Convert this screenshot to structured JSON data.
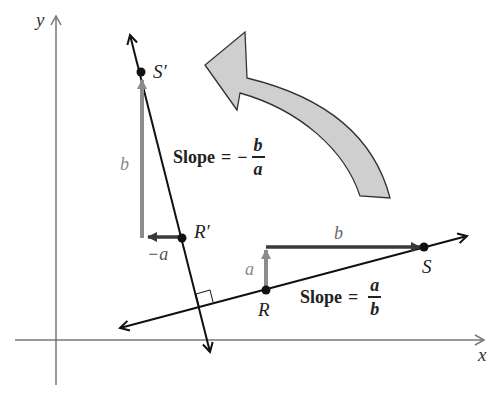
{
  "figure": {
    "axes": {
      "x_label": "x",
      "y_label": "y"
    },
    "points": {
      "S_prime": "S′",
      "R_prime": "R′",
      "R": "R",
      "S": "S"
    },
    "vectors": {
      "rise_original": "a",
      "run_original": "b",
      "rise_rotated": "b",
      "run_rotated": "−a"
    },
    "slope_rotated": {
      "prefix": "Slope",
      "equals": "=",
      "sign": "−",
      "numerator": "b",
      "denominator": "a"
    },
    "slope_original": {
      "prefix": "Slope",
      "equals": "=",
      "numerator": "a",
      "denominator": "b"
    },
    "colors": {
      "line": "#111111",
      "axis": "#777777",
      "vector_dark": "#3a3a3a",
      "vector_grey": "#8c8c8c",
      "rotation_arrow_fill": "#cfcfcf",
      "rotation_arrow_stroke": "#333333"
    }
  }
}
